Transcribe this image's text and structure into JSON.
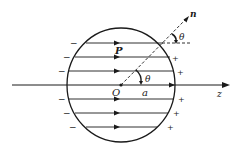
{
  "figure": {
    "type": "uniformly polarized sphere with surface bound charges",
    "labels": {
      "polarization": "P",
      "origin": "O",
      "radius": "a",
      "axis": "z",
      "normal": "n",
      "angle_inner": "θ",
      "angle_outer": "θ"
    },
    "left_charge_symbol": "−",
    "right_charge_symbol": "+",
    "left_charges_count": 6,
    "right_charges_count": 6,
    "field_lines_count": 7,
    "colors": {
      "stroke": "#1a1a1a",
      "background": "#ffffff"
    }
  }
}
